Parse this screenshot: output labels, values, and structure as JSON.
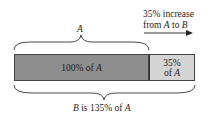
{
  "diagram": {
    "top_brace_label": "A",
    "bottom_brace_label_prefix": "B",
    "bottom_brace_label_rest": " is 135% of ",
    "bottom_brace_label_suffix": "A",
    "bar_main": {
      "label_prefix": "100% of ",
      "label_var": "A",
      "color": "#8e8e8e",
      "percent": 100
    },
    "bar_increase": {
      "line1": "35%",
      "line2_prefix": "of ",
      "line2_var": "A",
      "color": "#d4d4d4",
      "percent": 35
    },
    "annotation": {
      "line1": "35% increase",
      "line2_prefix": "from ",
      "line2_var1": "A",
      "line2_mid": " to ",
      "line2_var2": "B",
      "arrow": "right-arrow"
    }
  }
}
